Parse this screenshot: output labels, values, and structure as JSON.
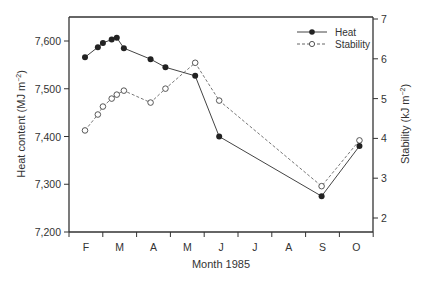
{
  "chart_data": {
    "type": "line",
    "title": "",
    "xlabel": "Month 1985",
    "ylabel": "Heat content (MJ m⁻²)",
    "ylabel_right": "Stability (kJ m⁻²)",
    "x_ticks": [
      "F",
      "M",
      "A",
      "M",
      "J",
      "J",
      "A",
      "S",
      "O"
    ],
    "ylim": [
      7200,
      7650
    ],
    "y_ticks": [
      "7,200",
      "7,300",
      "7,400",
      "7,500",
      "7,600"
    ],
    "ylim_right": [
      2,
      7
    ],
    "y_ticks_right": [
      "2",
      "3",
      "4",
      "5",
      "6",
      "7"
    ],
    "grid": false,
    "legend_position": "upper right",
    "series": [
      {
        "name": "Heat",
        "axis": "left",
        "style": "solid line, filled circles",
        "x_month": [
          1.0,
          1.38,
          1.53,
          1.79,
          1.94,
          2.15,
          2.94,
          3.38,
          4.26,
          4.97,
          8.0,
          9.12
        ],
        "values": [
          7566,
          7587,
          7596,
          7603,
          7607,
          7585,
          7562,
          7545,
          7527,
          7400,
          7275,
          7380
        ]
      },
      {
        "name": "Stability",
        "axis": "right",
        "style": "dashed line, open circles",
        "x_month": [
          1.0,
          1.38,
          1.53,
          1.79,
          1.94,
          2.15,
          2.94,
          3.38,
          4.26,
          4.97,
          8.0,
          9.12
        ],
        "values": [
          4.2,
          4.6,
          4.8,
          5.0,
          5.1,
          5.2,
          4.9,
          5.25,
          5.9,
          4.95,
          2.8,
          3.95
        ]
      }
    ]
  },
  "labels": {
    "xlabel": "Month 1985",
    "ylabel_main": "Heat content (MJ m",
    "ylabel_right_main": "Stability (kJ m",
    "unit_sup": "−2",
    "close_paren": ")",
    "legend_heat": "Heat",
    "legend_stability": "Stability"
  }
}
